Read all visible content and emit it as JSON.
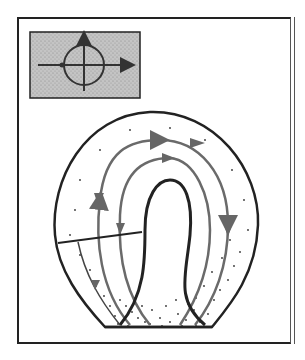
{
  "figure": {
    "type": "schematic diagram",
    "inset": {
      "description": "Circle with crosshair axes; horizontal axis arrow pointing right, vertical axis arrow pointing up",
      "background": "#b8b8b8"
    },
    "colors": {
      "outline": "#222222",
      "flow_lines": "#6a6a6a",
      "stipple": "#333333",
      "inset_fill": "#bdbdbd"
    },
    "flow_lines": [
      {
        "name": "outer-flow-line",
        "direction": "clockwise-down-left"
      },
      {
        "name": "inner-flow-line",
        "direction": "clockwise-down-left"
      }
    ],
    "labels": []
  }
}
